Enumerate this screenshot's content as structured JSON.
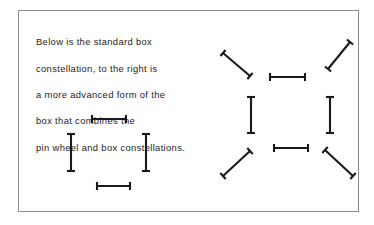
{
  "figure": {
    "background_color": "#ffffff",
    "border_color": "#8a8a8a",
    "stroke_color": "#1a1a1a"
  },
  "caption": {
    "lines": [
      "Below is the standard box",
      "constellation, to the right is",
      "a more advanced form of the",
      "box that combines the",
      "pin wheel and box constellations."
    ],
    "full_text": "Below is the standard box constellation, to the right is a more advanced form of the box that combines the pin wheel and box constellations."
  },
  "diagrams": [
    {
      "name": "standard-box-constellation",
      "label": "standard box constellation",
      "element_count": 4,
      "elements": [
        {
          "id": "top-bar",
          "orientation": "horizontal",
          "x1": 92,
          "y1": 119,
          "x2": 126,
          "y2": 119,
          "cap": 4.0
        },
        {
          "id": "left-bar",
          "orientation": "vertical",
          "x1": 71,
          "y1": 134,
          "x2": 71,
          "y2": 171,
          "cap": 4.0
        },
        {
          "id": "right-bar",
          "orientation": "vertical",
          "x1": 146,
          "y1": 134,
          "x2": 146,
          "y2": 171,
          "cap": 4.0
        },
        {
          "id": "bottom-bar",
          "orientation": "horizontal",
          "x1": 97,
          "y1": 186,
          "x2": 130,
          "y2": 186,
          "cap": 4.0
        }
      ]
    },
    {
      "name": "advanced-pinwheel-box-constellation",
      "label": "pin wheel and box constellation",
      "element_count": 8,
      "elements": [
        {
          "id": "top-left-diagonal",
          "orientation": "diagonal",
          "x1": 223,
          "y1": 53,
          "x2": 250,
          "y2": 76,
          "cap": 4.0
        },
        {
          "id": "top-right-diagonal",
          "orientation": "diagonal",
          "x1": 328,
          "y1": 69,
          "x2": 350,
          "y2": 42,
          "cap": 4.0
        },
        {
          "id": "top-bar",
          "orientation": "horizontal",
          "x1": 270,
          "y1": 77,
          "x2": 305,
          "y2": 77,
          "cap": 4.0
        },
        {
          "id": "left-bar",
          "orientation": "vertical",
          "x1": 251,
          "y1": 97,
          "x2": 251,
          "y2": 133,
          "cap": 4.0
        },
        {
          "id": "right-bar",
          "orientation": "vertical",
          "x1": 330,
          "y1": 97,
          "x2": 330,
          "y2": 133,
          "cap": 4.0
        },
        {
          "id": "bottom-bar",
          "orientation": "horizontal",
          "x1": 274,
          "y1": 148,
          "x2": 308,
          "y2": 148,
          "cap": 4.0
        },
        {
          "id": "bottom-left-diagonal",
          "orientation": "diagonal",
          "x1": 223,
          "y1": 176,
          "x2": 250,
          "y2": 151,
          "cap": 4.0
        },
        {
          "id": "bottom-right-diagonal",
          "orientation": "diagonal",
          "x1": 325,
          "y1": 150,
          "x2": 353,
          "y2": 176,
          "cap": 4.0
        }
      ]
    }
  ]
}
